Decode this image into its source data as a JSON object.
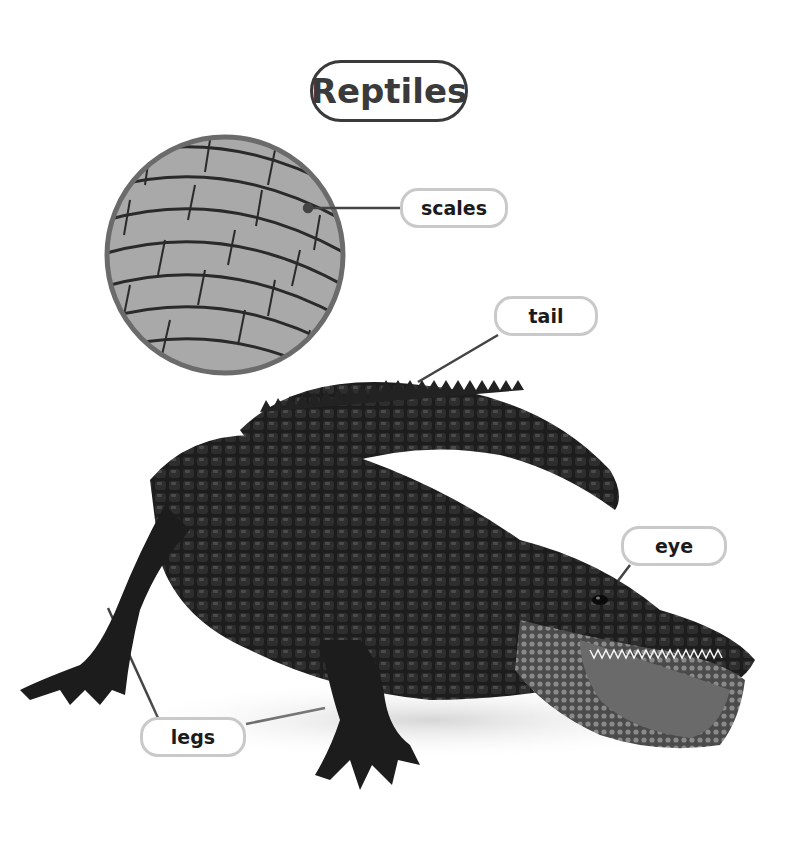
{
  "title": "Reptiles",
  "labels": {
    "scales": "scales",
    "tail": "tail",
    "eye": "eye",
    "legs": "legs"
  },
  "colors": {
    "title_border": "#3a3a3a",
    "label_border": "#c9c9c9",
    "leader_line": "#444444",
    "background": "#ffffff"
  }
}
